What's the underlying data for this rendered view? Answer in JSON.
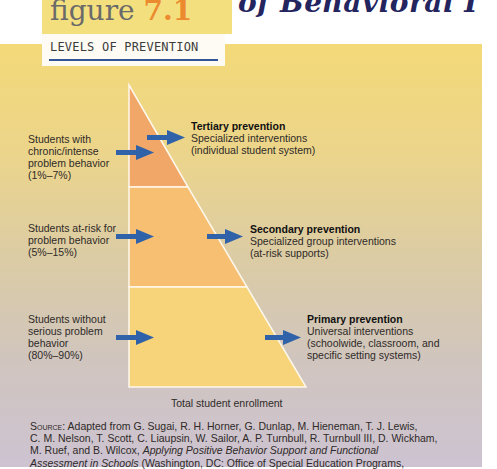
{
  "page": {
    "heading_fragment": "of Behavioral I"
  },
  "figure": {
    "prefix": "figure",
    "number": "7.1",
    "title": "LEVELS OF PREVENTION",
    "axis_label": "Total student enrollment",
    "colors": {
      "tier_top": "#f0a768",
      "tier_middle": "#f6bf72",
      "tier_bottom": "#f7d479",
      "arrow": "#2f62a8",
      "title_rule": "#34549a",
      "number_accent": "#ec8a2f",
      "heading": "#24245e"
    },
    "tiers": [
      {
        "students_lines": [
          "Students with",
          "chronic/intense",
          "problem behavior",
          "(1%–7%)"
        ],
        "prevention_title": "Tertiary prevention",
        "prevention_lines": [
          "Specialized interventions",
          "(individual student system)"
        ]
      },
      {
        "students_lines": [
          "Students at-risk for",
          "problem behavior",
          "(5%–15%)"
        ],
        "prevention_title": "Secondary prevention",
        "prevention_lines": [
          "Specialized group interventions",
          "(at-risk supports)"
        ]
      },
      {
        "students_lines": [
          "Students without",
          "serious problem",
          "behavior",
          "(80%–90%)"
        ],
        "prevention_title": "Primary prevention",
        "prevention_lines": [
          "Universal interventions",
          "(schoolwide, classroom, and",
          "specific setting systems)"
        ]
      }
    ],
    "source": {
      "label": "Source:",
      "line1": "Adapted from G. Sugai, R. H. Horner, G. Dunlap, M. Hieneman, T. J. Lewis,",
      "line2": "C. M. Nelson, T. Scott, C. Liaupsin, W. Sailor, A. P. Turnbull, R. Turnbull III, D. Wickham,",
      "line3_plain": "M. Ruef, and B. Wilcox, ",
      "line3_italic": "Applying Positive Behavior Support and Functional",
      "line4_italic": "Assessment in Schools",
      "line4_plain": " (Washington, DC: Office of Special Education Programs,"
    }
  }
}
